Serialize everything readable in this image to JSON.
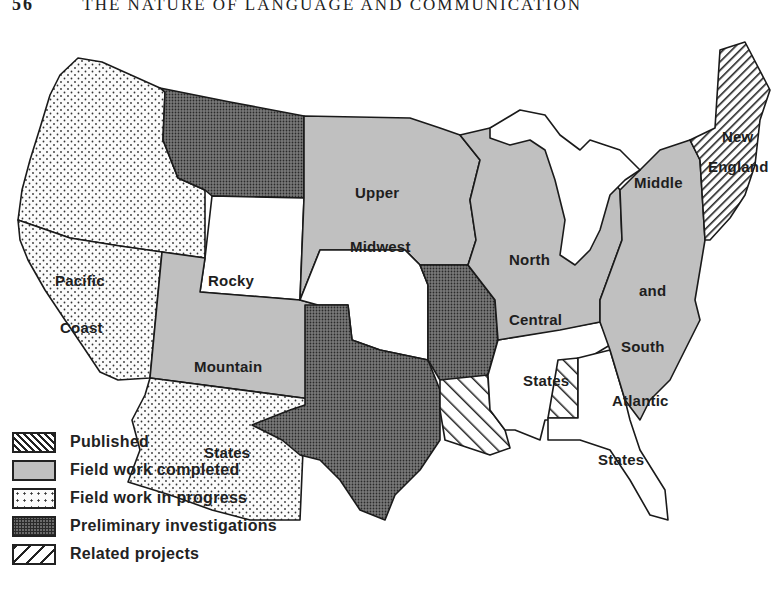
{
  "header": {
    "page_number": "56",
    "running_title": "THE NATURE OF LANGUAGE AND COMMUNICATION"
  },
  "map": {
    "title": "Linguistic Atlas of the United States — project status",
    "colors": {
      "outline": "#1a1a1a",
      "field_work_completed": "#c0c0c0",
      "preliminary_investigations": "#6a6a6a",
      "field_work_in_progress": "#fbfbfb",
      "blank": "#ffffff"
    },
    "regions": [
      {
        "id": "pacific-coast",
        "label_lines": [
          "Pacific",
          "Coast"
        ],
        "status": "Field work in progress"
      },
      {
        "id": "rocky-mountain-states",
        "label_lines": [
          "Rocky",
          "Mountain",
          "States"
        ],
        "status": "Field work completed / in progress"
      },
      {
        "id": "upper-midwest",
        "label_lines": [
          "Upper",
          "Midwest"
        ],
        "status": "Field work completed"
      },
      {
        "id": "north-central-states",
        "label_lines": [
          "North",
          "Central",
          "States"
        ],
        "status": "Field work completed"
      },
      {
        "id": "middle-south-atlantic",
        "label_lines": [
          "Middle",
          "and",
          "South",
          "Atlantic",
          "States"
        ],
        "status": "Field work completed"
      },
      {
        "id": "new-england",
        "label_lines": [
          "New",
          "England"
        ],
        "status": "Published"
      },
      {
        "id": "montana-texas-missouri",
        "label_lines": [],
        "status": "Preliminary investigations"
      },
      {
        "id": "louisiana-alabama",
        "label_lines": [],
        "status": "Related projects"
      }
    ]
  },
  "legend": {
    "items": [
      {
        "key": "published",
        "label": "Published"
      },
      {
        "key": "completed",
        "label": "Field work completed"
      },
      {
        "key": "progress",
        "label": "Field work in progress"
      },
      {
        "key": "prelim",
        "label": "Preliminary investigations"
      },
      {
        "key": "related",
        "label": "Related projects"
      }
    ]
  }
}
